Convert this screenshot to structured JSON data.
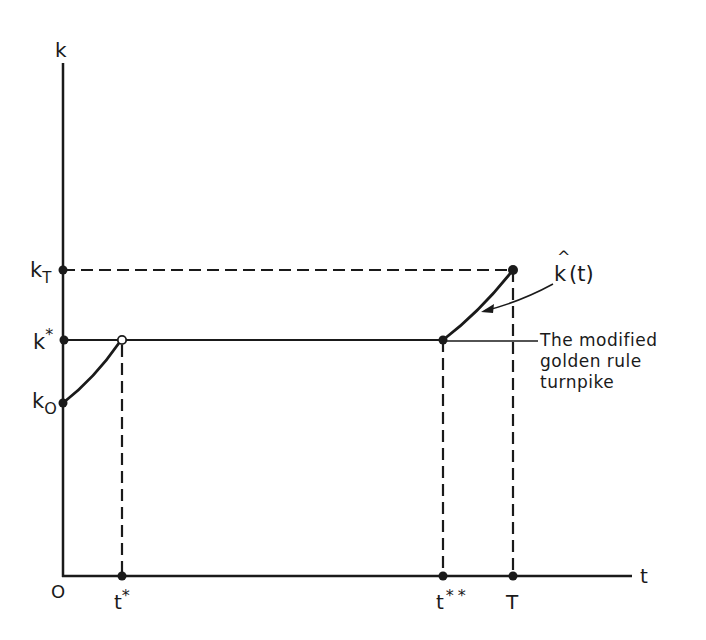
{
  "diagram": {
    "type": "economic-growth-turnpike",
    "axes": {
      "y_label": "k",
      "x_label": "t",
      "origin_label": "O"
    },
    "y_ticks": [
      {
        "id": "kT",
        "label": "k",
        "sub": "T"
      },
      {
        "id": "kstar",
        "label": "k",
        "sup": "*"
      },
      {
        "id": "k0",
        "label": "k",
        "sub": "O"
      }
    ],
    "x_ticks": [
      {
        "id": "tstar",
        "label": "t",
        "sup": "*"
      },
      {
        "id": "tstarstar",
        "label": "t",
        "sup": "**"
      },
      {
        "id": "T",
        "label": "T"
      }
    ],
    "curve_label": {
      "base": "k",
      "hat": "^",
      "arg": "(t)"
    },
    "annotation": {
      "lines": [
        "The modified",
        "golden rule",
        "turnpike"
      ]
    },
    "colors": {
      "ink": "#1a1a1a",
      "background": "#ffffff"
    }
  }
}
